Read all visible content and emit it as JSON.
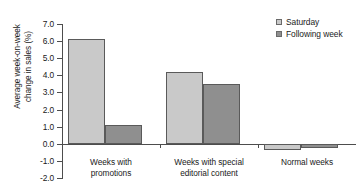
{
  "chart_data": {
    "type": "bar",
    "title": "",
    "xlabel": "",
    "ylabel_lines": [
      "Average week-on-week",
      "change in sales (%)"
    ],
    "ylabel": "Average week-on-week change in sales (%)",
    "ylim": [
      -2.0,
      7.0
    ],
    "ytick_labels": [
      "7.0",
      "6.0",
      "5.0",
      "4.0",
      "3.0",
      "2.0",
      "1.0",
      "0.0",
      "-1.0",
      "-2.0"
    ],
    "ytick_values": [
      7.0,
      6.0,
      5.0,
      4.0,
      3.0,
      2.0,
      1.0,
      0.0,
      -1.0,
      -2.0
    ],
    "grid": false,
    "legend_position": "top-right",
    "categories": [
      "Weeks with promotions",
      "Weeks with special editorial content",
      "Normal weeks"
    ],
    "category_lines": [
      [
        "Weeks with",
        "promotions"
      ],
      [
        "Weeks with special",
        "editorial content"
      ],
      [
        "Normal weeks"
      ]
    ],
    "series": [
      {
        "name": "Saturday",
        "color": "#c9c9c9",
        "values": [
          6.1,
          4.2,
          -0.35
        ]
      },
      {
        "name": "Following week",
        "color": "#8f8f8f",
        "values": [
          1.1,
          3.5,
          -0.25
        ]
      }
    ]
  }
}
